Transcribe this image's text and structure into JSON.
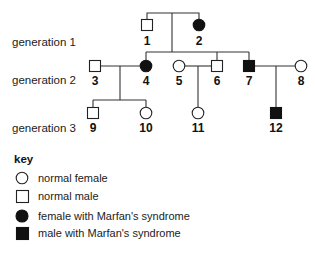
{
  "pedigree": {
    "generations": [
      {
        "label": "generation 1",
        "x": 12,
        "y": 46
      },
      {
        "label": "generation 2",
        "x": 12,
        "y": 84
      },
      {
        "label": "generation 3",
        "x": 12,
        "y": 132
      }
    ],
    "individuals": [
      {
        "id": "1",
        "sex": "male",
        "affected": false,
        "cx": 147,
        "cy": 25,
        "label_y": 45
      },
      {
        "id": "2",
        "sex": "female",
        "affected": true,
        "cx": 199,
        "cy": 25,
        "label_y": 45
      },
      {
        "id": "3",
        "sex": "male",
        "affected": false,
        "cx": 95,
        "cy": 66,
        "label_y": 85
      },
      {
        "id": "4",
        "sex": "female",
        "affected": true,
        "cx": 146,
        "cy": 66,
        "label_y": 85
      },
      {
        "id": "5",
        "sex": "female",
        "affected": false,
        "cx": 179,
        "cy": 66,
        "label_y": 85
      },
      {
        "id": "6",
        "sex": "male",
        "affected": false,
        "cx": 217,
        "cy": 66,
        "label_y": 85
      },
      {
        "id": "7",
        "sex": "male",
        "affected": true,
        "cx": 249,
        "cy": 66,
        "label_y": 85
      },
      {
        "id": "8",
        "sex": "female",
        "affected": false,
        "cx": 301,
        "cy": 66,
        "label_y": 85
      },
      {
        "id": "9",
        "sex": "male",
        "affected": false,
        "cx": 93,
        "cy": 113,
        "label_y": 132
      },
      {
        "id": "10",
        "sex": "female",
        "affected": false,
        "cx": 146,
        "cy": 113,
        "label_y": 132
      },
      {
        "id": "11",
        "sex": "female",
        "affected": false,
        "cx": 198,
        "cy": 113,
        "label_y": 132
      },
      {
        "id": "12",
        "sex": "male",
        "affected": true,
        "cx": 276,
        "cy": 113,
        "label_y": 132
      }
    ],
    "relationships": [
      {
        "type": "mating",
        "parents": [
          "1",
          "2"
        ],
        "children": [
          "4",
          "6",
          "7"
        ]
      },
      {
        "type": "mating",
        "parents": [
          "3",
          "4"
        ],
        "children": [
          "9",
          "10"
        ]
      },
      {
        "type": "mating",
        "parents": [
          "5",
          "6"
        ],
        "children": [
          "11"
        ]
      },
      {
        "type": "mating",
        "parents": [
          "7",
          "8"
        ],
        "children": [
          "12"
        ]
      }
    ]
  },
  "key": {
    "title": "key",
    "items": [
      {
        "symbol": "open-circle",
        "label": "normal female"
      },
      {
        "symbol": "open-square",
        "label": "normal male"
      },
      {
        "symbol": "filled-circle",
        "label": "female with Marfan's syndrome"
      },
      {
        "symbol": "filled-square",
        "label": "male with Marfan's syndrome"
      }
    ]
  }
}
